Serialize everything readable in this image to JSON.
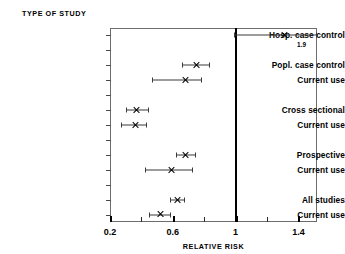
{
  "figure": {
    "header": "TYPE OF STUDY",
    "axis_title": "RELATIVE RISK"
  },
  "chart_data": {
    "type": "scatter",
    "subtype": "forest-plot",
    "title": "TYPE OF STUDY",
    "xlabel": "RELATIVE RISK",
    "ylabel": "",
    "xlim": [
      0.2,
      1.58
    ],
    "xticks": [
      0.2,
      0.6,
      1.0,
      1.4
    ],
    "xticklabels": [
      "0.2",
      "0.6",
      "1",
      "1.4"
    ],
    "minor_xticks": [
      0.4,
      0.8,
      1.2
    ],
    "grid": false,
    "legend": null,
    "reference_line": {
      "value": 1.0,
      "label": "1"
    },
    "categories": [
      "Hosp. case control",
      "Popl. case control",
      "Current use",
      "Cross sectional",
      "Current use",
      "Prospective",
      "Current use",
      "All studies",
      "Current use"
    ],
    "values": [
      1.31,
      0.75,
      0.68,
      0.37,
      0.36,
      0.68,
      0.59,
      0.63,
      0.52
    ],
    "ci_low": [
      0.99,
      0.66,
      0.47,
      0.3,
      0.27,
      0.62,
      0.42,
      0.58,
      0.45
    ],
    "ci_high": [
      1.58,
      0.83,
      0.78,
      0.44,
      0.43,
      0.74,
      0.72,
      0.67,
      0.58
    ],
    "annotations": [
      {
        "category": "Hosp. case control",
        "text": "1.9",
        "x": 1.42
      }
    ],
    "points": [
      {
        "label": "Hosp. case control",
        "estimate": 1.31,
        "ci_low": 0.99,
        "ci_high": 1.58,
        "group": "Hospital case control",
        "slot": 0,
        "annotation": "1.9"
      },
      {
        "label": "Popl. case control",
        "estimate": 0.75,
        "ci_low": 0.66,
        "ci_high": 0.83,
        "group": "Population case control",
        "slot": 2,
        "annotation": ""
      },
      {
        "label": "Current use",
        "estimate": 0.68,
        "ci_low": 0.47,
        "ci_high": 0.78,
        "group": "Population case control",
        "slot": 3,
        "annotation": ""
      },
      {
        "label": "Cross sectional",
        "estimate": 0.37,
        "ci_low": 0.3,
        "ci_high": 0.44,
        "group": "Cross sectional",
        "slot": 5,
        "annotation": ""
      },
      {
        "label": "Current use",
        "estimate": 0.36,
        "ci_low": 0.27,
        "ci_high": 0.43,
        "group": "Cross sectional",
        "slot": 6,
        "annotation": ""
      },
      {
        "label": "Prospective",
        "estimate": 0.68,
        "ci_low": 0.62,
        "ci_high": 0.74,
        "group": "Prospective",
        "slot": 8,
        "annotation": ""
      },
      {
        "label": "Current use",
        "estimate": 0.59,
        "ci_low": 0.42,
        "ci_high": 0.72,
        "group": "Prospective",
        "slot": 9,
        "annotation": ""
      },
      {
        "label": "All studies",
        "estimate": 0.63,
        "ci_low": 0.58,
        "ci_high": 0.67,
        "group": "All studies",
        "slot": 11,
        "annotation": ""
      },
      {
        "label": "Current use",
        "estimate": 0.52,
        "ci_low": 0.45,
        "ci_high": 0.58,
        "group": "All studies",
        "slot": 12,
        "annotation": ""
      }
    ]
  },
  "colors": {
    "ink": "#000000",
    "frame": "#6d6d6d",
    "line": "#3b3b3b",
    "background": "#ffffff"
  }
}
